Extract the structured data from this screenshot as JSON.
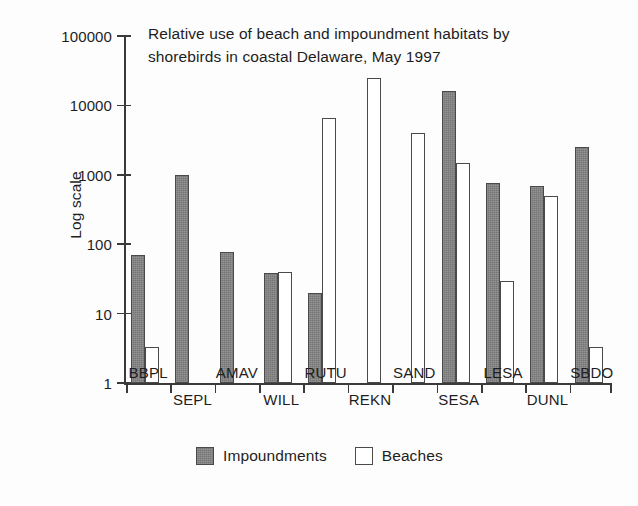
{
  "chart_data": {
    "type": "bar",
    "title": "Relative use of beach and impoundment habitats by shorebirds in coastal Delaware, May 1997",
    "title_line1": "Relative use of beach and impoundment habitats by",
    "title_line2": "shorebirds in coastal Delaware, May 1997",
    "xlabel": "",
    "ylabel": "Log scale",
    "yscale": "log",
    "ylim": [
      1,
      100000
    ],
    "ytick_labels": [
      "100000",
      "10000",
      "1000",
      "100",
      "10",
      "1"
    ],
    "yticks": [
      100000,
      10000,
      1000,
      100,
      10,
      1
    ],
    "grid": false,
    "legend_position": "bottom-center",
    "categories": [
      "BBPL",
      "SEPL",
      "AMAV",
      "WILL",
      "RUTU",
      "REKN",
      "SAND",
      "SESA",
      "LESA",
      "DUNL",
      "SBDO"
    ],
    "series": [
      {
        "name": "Impoundments",
        "color": "#767676",
        "values": [
          70,
          1000,
          78,
          38,
          20,
          null,
          null,
          16000,
          750,
          700,
          2500
        ]
      },
      {
        "name": "Beaches",
        "color": "#ffffff",
        "values": [
          3.3,
          null,
          null,
          40,
          6500,
          25000,
          4000,
          1500,
          30,
          500,
          3.3
        ]
      }
    ]
  },
  "legend": {
    "items": [
      {
        "label": "Impoundments",
        "swatch": "filled-gray-square"
      },
      {
        "label": "Beaches",
        "swatch": "empty-white-square"
      }
    ]
  },
  "axis": {
    "y_label": "Log scale",
    "y_tick_labels": [
      "100000",
      "10000",
      "1000",
      "100",
      "10",
      "1"
    ],
    "x_tick_labels": [
      "BBPL",
      "SEPL",
      "AMAV",
      "WILL",
      "RUTU",
      "REKN",
      "SAND",
      "SESA",
      "LESA",
      "DUNL",
      "SBDO"
    ]
  },
  "colors": {
    "impoundments_fill": "#767676",
    "beaches_fill": "#ffffff",
    "stroke": "#4a4a4a",
    "axis": "#3a3a3a",
    "text": "#1e1e1e",
    "background": "#fdfdfd"
  }
}
